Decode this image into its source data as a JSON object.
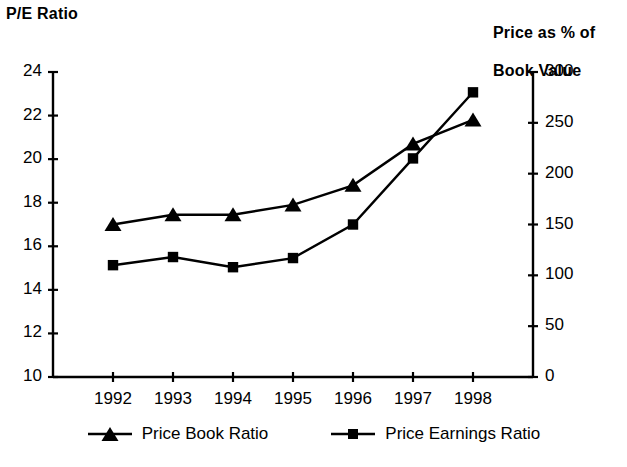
{
  "chart_data": {
    "type": "line",
    "title": "",
    "categories": [
      "1992",
      "1993",
      "1994",
      "1995",
      "1996",
      "1997",
      "1998"
    ],
    "x": [
      1992,
      1993,
      1994,
      1995,
      1996,
      1997,
      1998
    ],
    "series": [
      {
        "name": "Price Book Ratio",
        "marker": "triangle",
        "axis": "left",
        "values": [
          17.0,
          17.45,
          17.45,
          17.9,
          18.8,
          20.7,
          21.8
        ]
      },
      {
        "name": "Price Earnings Ratio",
        "marker": "square",
        "axis": "right",
        "values": [
          110,
          118,
          108,
          117,
          150,
          215,
          280
        ]
      }
    ],
    "left_axis": {
      "label": "P/E Ratio",
      "ticks": [
        10,
        12,
        14,
        16,
        18,
        20,
        22,
        24
      ],
      "tick_labels": [
        "10",
        "12",
        "14",
        "16",
        "18",
        "20",
        "22",
        "24"
      ],
      "ylim": [
        10,
        24
      ]
    },
    "right_axis": {
      "label": "Price as % of\nBook Value",
      "ticks": [
        0,
        50,
        100,
        150,
        200,
        250,
        300
      ],
      "tick_labels": [
        "0",
        "50",
        "100",
        "150",
        "200",
        "250",
        "300"
      ],
      "ylim": [
        0,
        300
      ]
    },
    "xlabel": "",
    "grid": false,
    "legend_position": "bottom",
    "legend": [
      "Price Book Ratio",
      "Price Earnings Ratio"
    ],
    "colors": {
      "line": "#000000",
      "marker": "#000000",
      "axis": "#000000",
      "background": "#ffffff"
    }
  },
  "axis_titles": {
    "left": "P/E Ratio",
    "right_line1": "Price as % of",
    "right_line2": "Book Value"
  },
  "legend": {
    "items": [
      {
        "label": "Price Book Ratio",
        "marker": "triangle-marker"
      },
      {
        "label": "Price Earnings Ratio",
        "marker": "square-marker"
      }
    ]
  }
}
